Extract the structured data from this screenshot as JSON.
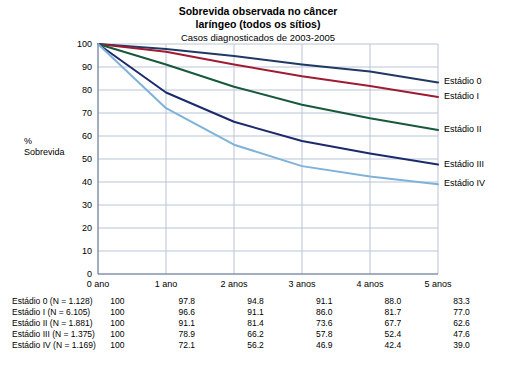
{
  "chart_data": {
    "type": "line",
    "title": "Sobrevida observada no câncer",
    "title2": "laríngeo (todos os sítios)",
    "subtitle": "Casos diagnosticados de 2003-2005",
    "xlabel": "",
    "ylabel_line1": "%",
    "ylabel_line2": "Sobrevida",
    "categories": [
      "0 ano",
      "1 ano",
      "2 anos",
      "3 anos",
      "4 anos",
      "5 anos"
    ],
    "ylim": [
      0,
      100
    ],
    "yticks": [
      0,
      10,
      20,
      30,
      40,
      50,
      60,
      70,
      80,
      90,
      100
    ],
    "grid": true,
    "legend_position": "right-inline",
    "series": [
      {
        "name": "Estádio 0",
        "row_label": "Estádio 0 (N = 1.128)",
        "color": "#1f3864",
        "values": [
          100,
          97.8,
          94.8,
          91.1,
          88.0,
          83.3
        ],
        "values_text": [
          "100",
          "97.8",
          "94.8",
          "91.1",
          "88.0",
          "83.3"
        ]
      },
      {
        "name": "Estádio I",
        "row_label": "Estádio I (N = 6.105)",
        "color": "#9e1b32",
        "values": [
          100,
          96.6,
          91.1,
          86.0,
          81.7,
          77.0
        ],
        "values_text": [
          "100",
          "96.6",
          "91.1",
          "86.0",
          "81.7",
          "77.0"
        ]
      },
      {
        "name": "Estádio II",
        "row_label": "Estádio II (N = 1.881)",
        "color": "#17593a",
        "values": [
          100,
          91.1,
          81.4,
          73.6,
          67.7,
          62.6
        ],
        "values_text": [
          "100",
          "91.1",
          "81.4",
          "73.6",
          "67.7",
          "62.6"
        ]
      },
      {
        "name": "Estádio III",
        "row_label": "Estádio III (N = 1.375)",
        "color": "#1b2a6b",
        "values": [
          100,
          78.9,
          66.2,
          57.8,
          52.4,
          47.6
        ],
        "values_text": [
          "100",
          "78.9",
          "66.2",
          "57.8",
          "52.4",
          "47.6"
        ]
      },
      {
        "name": "Estádio IV",
        "row_label": "Estádio IV (N = 1.169)",
        "color": "#7fb2d9",
        "values": [
          100,
          72.1,
          56.2,
          46.9,
          42.4,
          39.0
        ],
        "values_text": [
          "100",
          "72.1",
          "56.2",
          "46.9",
          "42.4",
          "39.0"
        ]
      }
    ]
  }
}
